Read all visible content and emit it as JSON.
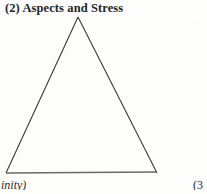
{
  "page": {
    "background_color": "#fdfdfc",
    "width": 207,
    "height": 194
  },
  "heading": {
    "text": "(2) Aspects and Stress",
    "color": "#252525"
  },
  "figure": {
    "name": "triangle-diagram",
    "shape": "triangle",
    "fill": "none",
    "stroke_color": "#3a3a3a",
    "base_stroke_color": "#6a6a6a",
    "apex": {
      "x": 78,
      "y": 17
    },
    "bottom_left": {
      "x": 6,
      "y": 173
    },
    "bottom_right": {
      "x": 157,
      "y": 173
    }
  },
  "captions": {
    "bottom_left_clipped": "inity)",
    "bottom_right_clipped": "(3"
  }
}
